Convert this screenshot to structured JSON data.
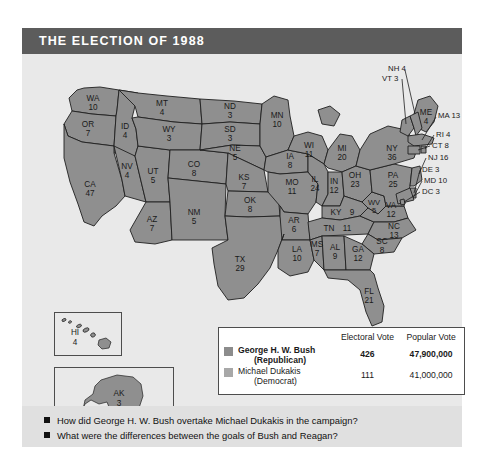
{
  "figure": {
    "title": "THE ELECTION OF 1988"
  },
  "map": {
    "states": [
      {
        "code": "WA",
        "votes": "10"
      },
      {
        "code": "OR",
        "votes": "7"
      },
      {
        "code": "ID",
        "votes": "4"
      },
      {
        "code": "MT",
        "votes": "4"
      },
      {
        "code": "WY",
        "votes": "3"
      },
      {
        "code": "ND",
        "votes": "3"
      },
      {
        "code": "SD",
        "votes": "3"
      },
      {
        "code": "MN",
        "votes": "10"
      },
      {
        "code": "WI",
        "votes": "11"
      },
      {
        "code": "MI",
        "votes": "20"
      },
      {
        "code": "NV",
        "votes": "4"
      },
      {
        "code": "UT",
        "votes": "5"
      },
      {
        "code": "CO",
        "votes": "8"
      },
      {
        "code": "NE",
        "votes": "5"
      },
      {
        "code": "IA",
        "votes": "8"
      },
      {
        "code": "IL",
        "votes": "24"
      },
      {
        "code": "IN",
        "votes": "12"
      },
      {
        "code": "OH",
        "votes": "23"
      },
      {
        "code": "CA",
        "votes": "47"
      },
      {
        "code": "AZ",
        "votes": "7"
      },
      {
        "code": "NM",
        "votes": "5"
      },
      {
        "code": "KS",
        "votes": "7"
      },
      {
        "code": "MO",
        "votes": "11"
      },
      {
        "code": "KY",
        "votes": "9"
      },
      {
        "code": "WV",
        "votes": "5"
      },
      {
        "code": "VA",
        "votes": "12"
      },
      {
        "code": "OK",
        "votes": "8"
      },
      {
        "code": "AR",
        "votes": "6"
      },
      {
        "code": "TN",
        "votes": "11"
      },
      {
        "code": "NC",
        "votes": "13"
      },
      {
        "code": "SC",
        "votes": "8"
      },
      {
        "code": "TX",
        "votes": "29"
      },
      {
        "code": "LA",
        "votes": "10"
      },
      {
        "code": "MS",
        "votes": "7"
      },
      {
        "code": "AL",
        "votes": "9"
      },
      {
        "code": "GA",
        "votes": "12"
      },
      {
        "code": "FL",
        "votes": "21"
      },
      {
        "code": "PA",
        "votes": "25"
      },
      {
        "code": "NY",
        "votes": "36"
      },
      {
        "code": "ME",
        "votes": "4"
      },
      {
        "code": "HI",
        "votes": "4"
      },
      {
        "code": "AK",
        "votes": "3"
      }
    ],
    "leader_labels": [
      {
        "text": "NH 4"
      },
      {
        "text": "VT 3"
      },
      {
        "text": "MA 13"
      },
      {
        "text": "RI 4"
      },
      {
        "text": "CT 8"
      },
      {
        "text": "NJ 16"
      },
      {
        "text": "DE 3"
      },
      {
        "text": "MD 10"
      },
      {
        "text": "DC 3"
      }
    ],
    "colors": {
      "state_fill": "#8f8f8f",
      "state_stroke": "#1f1f1f",
      "water": "#e9e9e9"
    }
  },
  "legend": {
    "columns": {
      "candidate": "",
      "electoral_vote": "Electoral Vote",
      "popular_vote": "Popular Vote"
    },
    "rows": [
      {
        "name": "George H. W. Bush",
        "party": "(Republican)",
        "electoral_vote": "426",
        "popular_vote": "47,900,000",
        "swatch_color": "#8c8c8c"
      },
      {
        "name": "Michael Dukakis",
        "party": "(Democrat)",
        "electoral_vote": "111",
        "popular_vote": "41,000,000",
        "swatch_color": "#a8a8a8"
      }
    ]
  },
  "questions": [
    "How did George H. W. Bush overtake Michael Dukakis in the campaign?",
    "What were the differences between the goals of Bush and Reagan?"
  ]
}
